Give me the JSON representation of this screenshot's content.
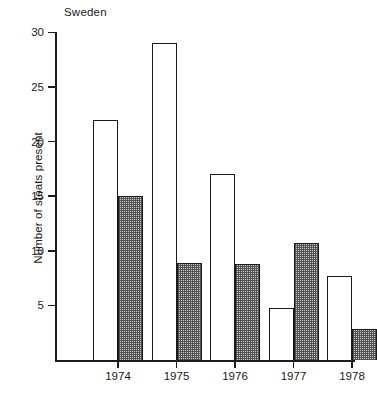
{
  "chart_data": {
    "type": "bar",
    "title": "Sweden",
    "xlabel": "",
    "ylabel": "Number of stoats present",
    "categories": [
      "1974",
      "1975",
      "1976",
      "1977",
      "1978"
    ],
    "ylim": [
      0,
      30
    ],
    "yticks": [
      5,
      10,
      15,
      20,
      25,
      30
    ],
    "ytick_labels": [
      "5",
      "10",
      "15",
      "20",
      "25",
      "30"
    ],
    "grid": false,
    "legend": "none",
    "series": [
      {
        "name": "open",
        "style": "open-white-bar",
        "values": [
          22,
          29,
          17,
          4.8,
          7.7
        ]
      },
      {
        "name": "hatched",
        "style": "stippled-grey-bar",
        "values": [
          15,
          8.9,
          8.8,
          10.7,
          2.8
        ]
      }
    ]
  },
  "colors": {
    "axis": "#1a1a1a",
    "open_bar_fill": "#ffffff",
    "open_bar_stroke": "#1a1a1a",
    "hatched_bar_fill": "#c9c9c9",
    "hatched_bar_stroke": "#1a1a1a",
    "background": "#ffffff"
  },
  "axis": {
    "y_tick_labels": [
      "30",
      "25",
      "20",
      "15",
      "10",
      "5"
    ],
    "x_tick_labels": [
      "1974",
      "1975",
      "1976",
      "1977",
      "1978"
    ]
  }
}
